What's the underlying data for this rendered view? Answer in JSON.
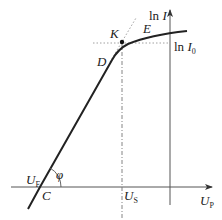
{
  "diagram": {
    "type": "probe-characteristic",
    "labels": {
      "y_axis": {
        "fn": "ln",
        "var": "I"
      },
      "ln_i0": {
        "fn": "ln",
        "var": "I",
        "sub": "0"
      },
      "x_axis": {
        "var": "U",
        "sub": "P"
      },
      "u_f": {
        "var": "U",
        "sub": "F"
      },
      "u_s": {
        "var": "U",
        "sub": "S"
      },
      "point_c": "C",
      "point_d": "D",
      "point_e": "E",
      "point_k": "K",
      "angle": "φ"
    },
    "colors": {
      "curve": "#222222",
      "axes": "#444444",
      "guides": "#888888"
    }
  }
}
